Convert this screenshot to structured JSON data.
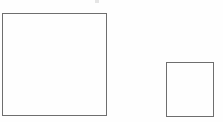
{
  "canvas": {
    "width": 223,
    "height": 122,
    "background_color": "#fefefe",
    "title": "Two squares outline diagram"
  },
  "shapes": [
    {
      "name": "large-square",
      "label": "Large square",
      "type": "rectangle",
      "x": 2,
      "y": 13,
      "width": 105,
      "height": 103,
      "stroke_color": "#6e6e6e",
      "stroke_width": 1,
      "fill": "none"
    },
    {
      "name": "small-square",
      "label": "Small square",
      "type": "rectangle",
      "x": 166,
      "y": 62,
      "width": 48,
      "height": 55,
      "stroke_color": "#6e6e6e",
      "stroke_width": 1,
      "fill": "none"
    }
  ],
  "artifacts": [
    {
      "name": "scan-speck",
      "label": "Faint scan speck",
      "x": 95,
      "y": 0,
      "width": 4,
      "height": 3,
      "color": "#b8b8b8"
    }
  ]
}
